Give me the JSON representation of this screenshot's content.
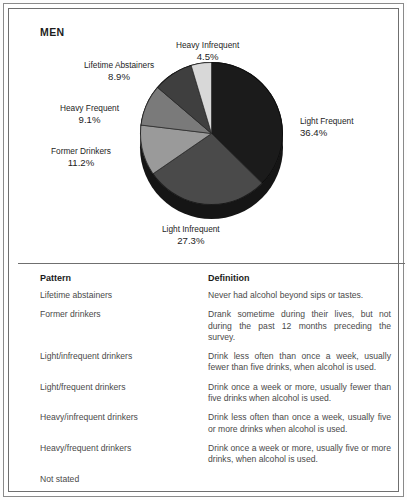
{
  "figure": {
    "panel_title": "MEN"
  },
  "chart_data": {
    "type": "pie",
    "title": "MEN",
    "subtitle": "",
    "xlabel": "",
    "ylabel": "",
    "legend_position": "callout-labels",
    "grid": false,
    "categories": [
      "Light Frequent",
      "Light Infrequent",
      "Former Drinkers",
      "Heavy Frequent",
      "Lifetime Abstainers",
      "Heavy Infrequent"
    ],
    "values": [
      36.4,
      27.3,
      11.2,
      9.1,
      8.9,
      4.5
    ],
    "value_labels": [
      "36.4%",
      "27.3%",
      "11.2%",
      "9.1%",
      "8.9%",
      "4.5%"
    ],
    "colors": [
      "#1b1b1b",
      "#4a4a4a",
      "#9a9a9a",
      "#7a7a7a",
      "#3f3f3f",
      "#d8d8d8"
    ],
    "slices": [
      {
        "name": "Light Frequent",
        "value": 36.4,
        "value_label": "36.4%",
        "color": "#1b1b1b"
      },
      {
        "name": "Light Infrequent",
        "value": 27.3,
        "value_label": "27.3%",
        "color": "#4a4a4a"
      },
      {
        "name": "Former Drinkers",
        "value": 11.2,
        "value_label": "11.2%",
        "color": "#9a9a9a"
      },
      {
        "name": "Heavy Frequent",
        "value": 9.1,
        "value_label": "9.1%",
        "color": "#7a7a7a"
      },
      {
        "name": "Lifetime Abstainers",
        "value": 8.9,
        "value_label": "8.9%",
        "color": "#3f3f3f"
      },
      {
        "name": "Heavy Infrequent",
        "value": 4.5,
        "value_label": "4.5%",
        "color": "#d8d8d8"
      }
    ]
  },
  "table": {
    "headers": {
      "pattern": "Pattern",
      "definition": "Definition"
    },
    "rows": [
      {
        "pattern": "Lifetime abstainers",
        "definition": "Never had alcohol beyond sips or tastes."
      },
      {
        "pattern": "Former drinkers",
        "definition": "Drank sometime during their lives, but not during the past 12 months preceding the survey."
      },
      {
        "pattern": "Light/infrequent drinkers",
        "definition": "Drink less often than once a week, usually fewer than five drinks, when alcohol is used."
      },
      {
        "pattern": "Light/frequent drinkers",
        "definition": "Drink once a week or more, usually fewer than five drinks when alcohol is used."
      },
      {
        "pattern": "Heavy/infrequent drinkers",
        "definition": "Drink less often than once a week, usually five or more drinks when alcohol is used."
      },
      {
        "pattern": "Heavy/frequent drinkers",
        "definition": "Drink once a week or more, usually five or more drinks, when alcohol is used."
      },
      {
        "pattern": "Not stated",
        "definition": ""
      }
    ]
  }
}
